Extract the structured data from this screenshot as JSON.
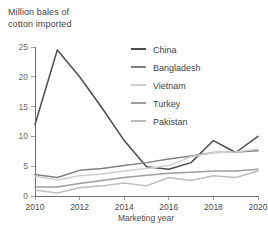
{
  "chart_data": {
    "type": "line",
    "title_line1": "Million bales of",
    "title_line2": "cotton imported",
    "xlabel": "Marketing year",
    "ylabel": "",
    "xlim": [
      2010,
      2020
    ],
    "ylim": [
      0,
      25
    ],
    "grid": false,
    "legend_position": "inside-top-right",
    "x": [
      2010,
      2011,
      2012,
      2013,
      2014,
      2015,
      2016,
      2017,
      2018,
      2019,
      2020
    ],
    "xticks": [
      2010,
      2012,
      2014,
      2016,
      2018,
      2020
    ],
    "xtick_labels": [
      "2010",
      "2012",
      "2014",
      "2016",
      "2018",
      "2020"
    ],
    "yticks": [
      0,
      5,
      10,
      15,
      20,
      25
    ],
    "ytick_labels": [
      "0",
      "5",
      "10",
      "15",
      "20",
      "25"
    ],
    "series": [
      {
        "name": "China",
        "color": "#4d4d4d",
        "values": [
          12.0,
          24.5,
          20.0,
          14.8,
          9.3,
          4.9,
          4.5,
          5.6,
          9.3,
          7.3,
          10.0
        ]
      },
      {
        "name": "Bangladesh",
        "color": "#808080",
        "values": [
          3.6,
          3.1,
          4.3,
          4.6,
          5.1,
          5.6,
          6.2,
          6.7,
          7.3,
          7.4,
          7.6
        ]
      },
      {
        "name": "Vietnam",
        "color": "#cfcfcf",
        "values": [
          3.3,
          2.7,
          3.4,
          3.7,
          4.2,
          4.6,
          5.1,
          6.6,
          7.3,
          7.4,
          7.9
        ]
      },
      {
        "name": "Turkey",
        "color": "#9e9e9e",
        "values": [
          1.5,
          1.5,
          2.1,
          2.6,
          3.1,
          3.5,
          3.8,
          4.0,
          4.2,
          4.2,
          4.5
        ]
      },
      {
        "name": "Pakistan",
        "color": "#bdbdbd",
        "values": [
          1.0,
          0.5,
          1.4,
          1.7,
          2.2,
          1.7,
          3.1,
          2.6,
          3.4,
          3.1,
          4.2
        ]
      }
    ]
  },
  "legend": {
    "items": [
      {
        "label": "China",
        "color": "#4d4d4d"
      },
      {
        "label": "Bangladesh",
        "color": "#808080"
      },
      {
        "label": "Vietnam",
        "color": "#cfcfcf"
      },
      {
        "label": "Turkey",
        "color": "#9e9e9e"
      },
      {
        "label": "Pakistan",
        "color": "#bdbdbd"
      }
    ]
  },
  "colors": {
    "background": "#ffffff",
    "axis": "#6e6e6e",
    "text": "#3f3f3f",
    "tick_text": "#6b6b6b"
  }
}
